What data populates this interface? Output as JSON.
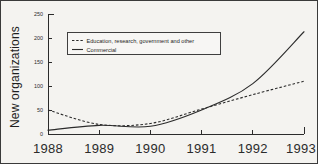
{
  "chart_data": {
    "type": "line",
    "title": "",
    "xlabel": "",
    "ylabel": "New organizations",
    "x": [
      1988,
      1989,
      1990,
      1991,
      1992,
      1993
    ],
    "xtick_labels": [
      "1988",
      "1989",
      "1990",
      "1991",
      "1992",
      "1993"
    ],
    "ytick_labels": [
      "0",
      "50",
      "100",
      "150",
      "200",
      "250"
    ],
    "ytick_values": [
      0,
      50,
      100,
      150,
      200,
      250
    ],
    "ylim": [
      0,
      250
    ],
    "xlim": [
      1988,
      1993
    ],
    "grid": false,
    "legend_position": "upper-left-inside",
    "series": [
      {
        "name": "Education, research, government and other",
        "style": "dashed",
        "color": "#2b2b2b",
        "values": [
          50,
          20,
          22,
          52,
          82,
          110
        ]
      },
      {
        "name": "Commercial",
        "style": "solid",
        "color": "#2b2b2b",
        "values": [
          8,
          18,
          16,
          50,
          105,
          213
        ]
      }
    ]
  },
  "figure": {
    "background_color": "#f4f3f0",
    "border_color": "#3a3a3a",
    "ink_color": "#2b2b2b"
  }
}
